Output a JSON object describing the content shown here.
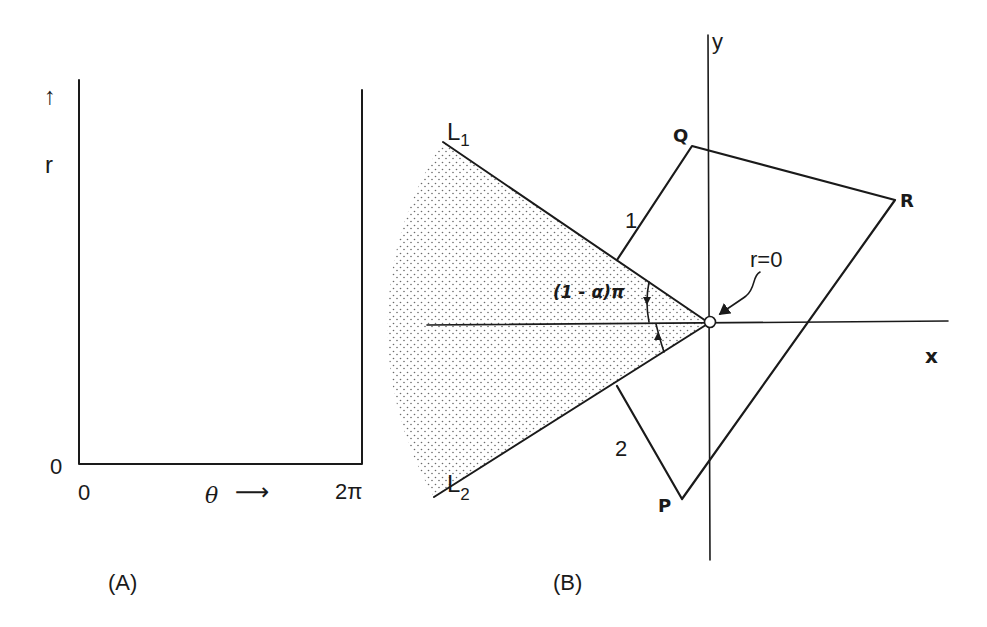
{
  "panel_a": {
    "caption": "(A)",
    "r_axis_label": "r",
    "r_arrow": "↑",
    "r_origin_label": "0",
    "theta_origin_label": "0",
    "theta_axis_label": "θ",
    "theta_arrow": "⟶",
    "theta_end_label": "2π"
  },
  "panel_b": {
    "caption": "(B)",
    "y_axis_label": "y",
    "x_axis_label": "x",
    "line_1_label": "L",
    "line_1_sub": "1",
    "line_2_label": "L",
    "line_2_sub": "2",
    "side_1_label": "1",
    "side_2_label": "2",
    "vertex_p": "P",
    "vertex_q": "Q",
    "vertex_r": "R",
    "origin_label": "r=0",
    "angle_label": "(1 - α)π"
  },
  "colors": {
    "ink": "#1a1a1a",
    "stipple": "#6b6b6b",
    "background": "#ffffff"
  }
}
